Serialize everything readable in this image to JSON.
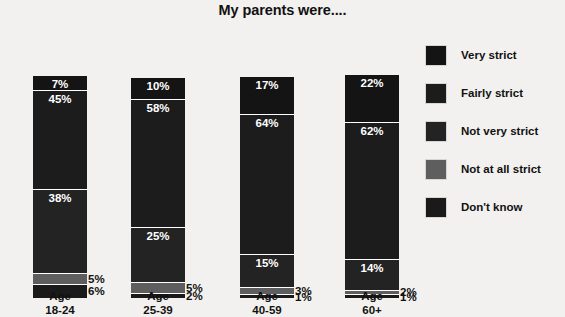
{
  "chart": {
    "title": "My parents were....",
    "background_color": "#f2f1ef",
    "text_color": "#111111"
  },
  "legend": {
    "items": [
      {
        "label": "Very strict",
        "color": "#141414"
      },
      {
        "label": "Fairly strict",
        "color": "#1c1c1c"
      },
      {
        "label": "Not very strict",
        "color": "#232323"
      },
      {
        "label": "Not at all strict",
        "color": "#5e5e5e"
      },
      {
        "label": "Don't know",
        "color": "#1a1a1a"
      }
    ]
  },
  "axis": {
    "groups": [
      {
        "line1": "Age",
        "line2": "18-24"
      },
      {
        "line1": "Age",
        "line2": "25-39"
      },
      {
        "line1": "Age",
        "line2": "40-59"
      },
      {
        "line1": "Age",
        "line2": "60+"
      }
    ]
  },
  "chart_data": {
    "type": "bar",
    "title": "My parents were....",
    "xlabel": "",
    "ylabel": "",
    "ylim": [
      0,
      100
    ],
    "grid": false,
    "legend_position": "right",
    "stacked": true,
    "units": "percent",
    "categories": [
      "Age 18-24",
      "Age 25-39",
      "Age 40-59",
      "Age 60+"
    ],
    "series": [
      {
        "name": "Very strict",
        "color": "#141414",
        "values": [
          7,
          10,
          17,
          22
        ],
        "labels": [
          "7%",
          "10%",
          "17%",
          "22%"
        ]
      },
      {
        "name": "Fairly strict",
        "color": "#1c1c1c",
        "values": [
          45,
          58,
          64,
          62
        ],
        "labels": [
          "45%",
          "58%",
          "64%",
          "62%"
        ]
      },
      {
        "name": "Not very strict",
        "color": "#232323",
        "values": [
          38,
          25,
          15,
          14
        ],
        "labels": [
          "38%",
          "25%",
          "15%",
          "14%"
        ]
      },
      {
        "name": "Not at all strict",
        "color": "#5e5e5e",
        "values": [
          5,
          5,
          3,
          2
        ],
        "labels": [
          "5%",
          "5%",
          "3%",
          "2%"
        ]
      },
      {
        "name": "Don't know",
        "color": "#1a1a1a",
        "values": [
          6,
          2,
          1,
          1
        ],
        "labels": [
          "6%",
          "2%",
          "1%",
          "1%"
        ]
      }
    ]
  },
  "bars": [
    {
      "group": "Age 18-24",
      "left": 33,
      "label_left": 21,
      "segments": [
        {
          "name": "Very strict",
          "value": 7,
          "label": "7%",
          "color": "#141414",
          "outside": false
        },
        {
          "name": "Fairly strict",
          "value": 45,
          "label": "45%",
          "color": "#1c1c1c",
          "outside": false
        },
        {
          "name": "Not very strict",
          "value": 38,
          "label": "38%",
          "color": "#232323",
          "outside": false
        },
        {
          "name": "Not at all strict",
          "value": 5,
          "label": "5%",
          "color": "#5e5e5e",
          "outside": true
        },
        {
          "name": "Don't know",
          "value": 6,
          "label": "6%",
          "color": "#1a1a1a",
          "outside": true
        }
      ]
    },
    {
      "group": "Age 25-39",
      "left": 131,
      "label_left": 119,
      "segments": [
        {
          "name": "Very strict",
          "value": 10,
          "label": "10%",
          "color": "#141414",
          "outside": false
        },
        {
          "name": "Fairly strict",
          "value": 58,
          "label": "58%",
          "color": "#1c1c1c",
          "outside": false
        },
        {
          "name": "Not very strict",
          "value": 25,
          "label": "25%",
          "color": "#232323",
          "outside": false
        },
        {
          "name": "Not at all strict",
          "value": 5,
          "label": "5%",
          "color": "#5e5e5e",
          "outside": true
        },
        {
          "name": "Don't know",
          "value": 2,
          "label": "2%",
          "color": "#1a1a1a",
          "outside": true
        }
      ]
    },
    {
      "group": "Age 40-59",
      "left": 240,
      "label_left": 228,
      "segments": [
        {
          "name": "Very strict",
          "value": 17,
          "label": "17%",
          "color": "#141414",
          "outside": false
        },
        {
          "name": "Fairly strict",
          "value": 64,
          "label": "64%",
          "color": "#1c1c1c",
          "outside": false
        },
        {
          "name": "Not very strict",
          "value": 15,
          "label": "15%",
          "color": "#232323",
          "outside": false
        },
        {
          "name": "Not at all strict",
          "value": 3,
          "label": "3%",
          "color": "#5e5e5e",
          "outside": true
        },
        {
          "name": "Don't know",
          "value": 1,
          "label": "1%",
          "color": "#1a1a1a",
          "outside": true
        }
      ]
    },
    {
      "group": "Age 60+",
      "left": 345,
      "label_left": 333,
      "segments": [
        {
          "name": "Very strict",
          "value": 22,
          "label": "22%",
          "color": "#141414",
          "outside": false
        },
        {
          "name": "Fairly strict",
          "value": 62,
          "label": "62%",
          "color": "#1c1c1c",
          "outside": false
        },
        {
          "name": "Not very strict",
          "value": 14,
          "label": "14%",
          "color": "#232323",
          "outside": false
        },
        {
          "name": "Not at all strict",
          "value": 2,
          "label": "2%",
          "color": "#5e5e5e",
          "outside": true
        },
        {
          "name": "Don't know",
          "value": 1,
          "label": "1%",
          "color": "#1a1a1a",
          "outside": true
        }
      ]
    }
  ]
}
